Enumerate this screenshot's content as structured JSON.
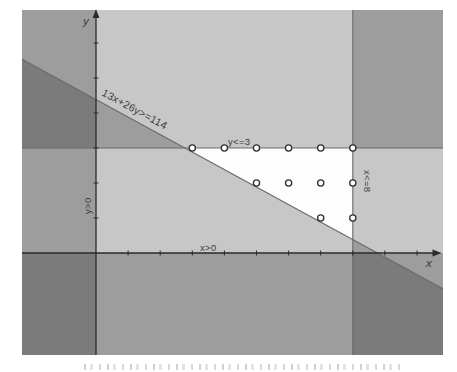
{
  "figure": {
    "colors": {
      "page_bg": "#ffffff",
      "plot_bg": "#fdfdfd",
      "shade": "#000000",
      "shade_opacity": 0.21,
      "boundary_line": "#6a6a6a",
      "axis": "#2a2a2a",
      "point_ring": "#2f2f2f",
      "point_fill": "#ffffff",
      "label_text": "#3c3c3c"
    }
  },
  "chart_data": {
    "type": "scatter",
    "title": "",
    "xlabel": "x",
    "ylabel": "y",
    "xlim": [
      -2.3,
      10.8
    ],
    "ylim": [
      -2.9,
      6.9
    ],
    "grid": false,
    "x_ticks": [
      1,
      2,
      3,
      4,
      5,
      6,
      7,
      8,
      9,
      10
    ],
    "y_ticks": [
      1,
      2,
      3,
      4,
      5,
      6
    ],
    "constraints": [
      {
        "label": "13x+26y>=114",
        "type": "line",
        "a": 13,
        "b": 26,
        "c": 114,
        "shade": "below",
        "boundary": true
      },
      {
        "label": "y<=3",
        "type": "hline",
        "y": 3,
        "shade": "above",
        "boundary": true
      },
      {
        "label": "x<=8",
        "type": "vline",
        "x": 8,
        "shade": "right",
        "boundary": true
      },
      {
        "label": "x>0",
        "type": "vline",
        "x": 0,
        "shade": "left",
        "boundary": false
      },
      {
        "label": "y>0",
        "type": "hline",
        "y": 0,
        "shade": "below",
        "boundary": false
      }
    ],
    "feasible_points": [
      [
        3,
        3
      ],
      [
        4,
        3
      ],
      [
        5,
        3
      ],
      [
        6,
        3
      ],
      [
        7,
        3
      ],
      [
        8,
        3
      ],
      [
        5,
        2
      ],
      [
        6,
        2
      ],
      [
        7,
        2
      ],
      [
        8,
        2
      ],
      [
        7,
        1
      ],
      [
        8,
        1
      ]
    ]
  }
}
